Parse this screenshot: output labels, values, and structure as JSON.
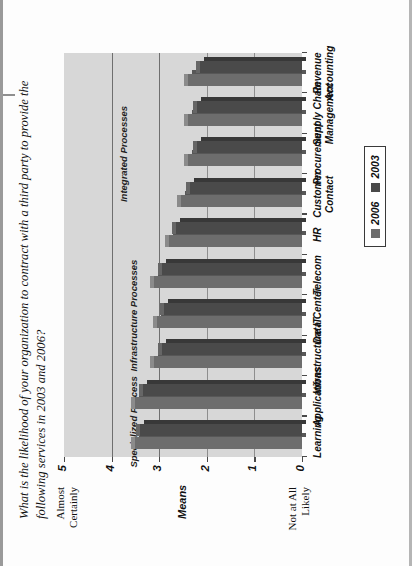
{
  "figure": {
    "title": "What is the likelihood of your organization to contract with a third party  to provide the following services in 2003 and 2006?",
    "axis_top_label": "Almost Certainly",
    "axis_bottom_label": "Not at All Likely",
    "value_axis_title": "Means"
  },
  "legend": {
    "items": [
      {
        "label": "2006",
        "color": "#6d6d6d"
      },
      {
        "label": "2003",
        "color": "#4a4a4a"
      }
    ]
  },
  "bands": [
    {
      "label": "Specialized Processes"
    },
    {
      "label": "Infrastructure Processes"
    },
    {
      "label": "Integrated Processes"
    }
  ],
  "chart_data": {
    "type": "bar",
    "title": "What is the likelihood of your organization to contract with a third party  to provide the following services in 2003 and 2006?",
    "xlabel": "",
    "ylabel": "Means",
    "ylim": [
      0,
      5
    ],
    "yticks": [
      "5",
      "4",
      "3",
      "2",
      "1",
      "0"
    ],
    "ytick_low_label": "Not at All Likely",
    "ytick_high_label": "Almost Certainly",
    "grid": true,
    "legend_position": "right",
    "orientation": "horizontal",
    "categories": [
      "Learning",
      "Applications",
      "Infrastructure IT",
      "Data Center",
      "Telecom",
      "HR",
      "Customer Contact",
      "Procurement",
      "Supply Chain Management",
      "Revenue Accounting"
    ],
    "category_groups": [
      {
        "label": "Specialized Processes",
        "categories": [
          "Learning",
          "Applications"
        ]
      },
      {
        "label": "Infrastructure Processes",
        "categories": [
          "Infrastructure IT",
          "Data Center",
          "Telecom"
        ]
      },
      {
        "label": "Integrated Processes",
        "categories": [
          "HR",
          "Customer Contact",
          "Procurement",
          "Supply Chain Management",
          "Revenue Accounting"
        ]
      }
    ],
    "series": [
      {
        "name": "2006",
        "color": "#6d6d6d",
        "values": [
          3.5,
          3.5,
          3.1,
          3.05,
          3.1,
          2.8,
          2.55,
          2.4,
          2.4,
          2.4
        ]
      },
      {
        "name": "2003",
        "color": "#4a4a4a",
        "values": [
          3.4,
          3.35,
          2.95,
          2.9,
          2.95,
          2.65,
          2.35,
          2.2,
          2.2,
          2.15
        ]
      }
    ]
  }
}
